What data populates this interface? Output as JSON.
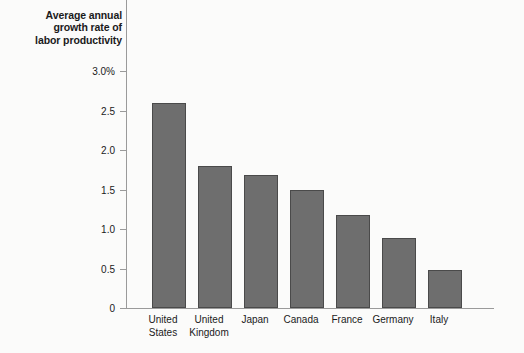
{
  "chart_data": {
    "type": "bar",
    "title": "Average annual growth rate of labor productivity",
    "title_lines": [
      "Average annual",
      "growth rate of",
      "labor productivity"
    ],
    "xlabel": "",
    "ylabel": "",
    "ylim": [
      0,
      3.0
    ],
    "grid": false,
    "legend": null,
    "categories": [
      "United States",
      "United Kingdom",
      "Japan",
      "Canada",
      "France",
      "Germany",
      "Italy"
    ],
    "category_lines": [
      [
        "United",
        "States"
      ],
      [
        "United",
        "Kingdom"
      ],
      [
        "Japan"
      ],
      [
        "Canada"
      ],
      [
        "France"
      ],
      [
        "Germany"
      ],
      [
        "Italy"
      ]
    ],
    "values": [
      2.6,
      1.8,
      1.68,
      1.5,
      1.18,
      0.88,
      0.48
    ],
    "ytick_values": [
      3.0,
      2.5,
      2.0,
      1.5,
      1.0,
      0.5,
      0
    ],
    "ytick_labels": [
      "3.0%",
      "2.5",
      "2.0",
      "1.5",
      "1.0",
      "0.5",
      "0"
    ],
    "bar_color": "#6e6e6e",
    "bar_edge_color": "#4a4a4a",
    "axis_color": "#9a9a9a",
    "text_color": "#1a1a1a",
    "background_color": "#fbfbfa"
  }
}
